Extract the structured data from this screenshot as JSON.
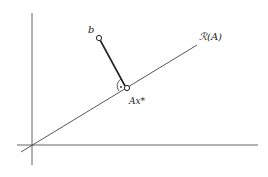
{
  "diagram": {
    "labels": {
      "b": "b",
      "range": "ℛ(A)",
      "projection": "Ax*"
    },
    "colors": {
      "line": "#333333",
      "background": "#ffffff"
    }
  }
}
